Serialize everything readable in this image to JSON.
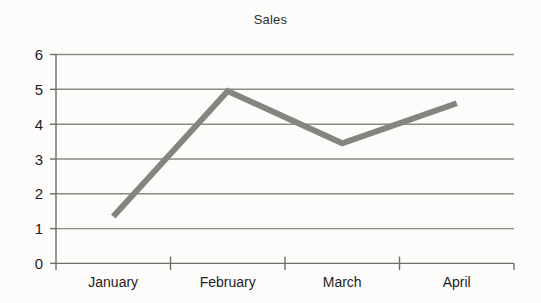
{
  "chart_data": {
    "type": "line",
    "title": "Sales",
    "xlabel": "",
    "ylabel": "",
    "categories": [
      "January",
      "February",
      "March",
      "April"
    ],
    "values": [
      1.35,
      4.95,
      3.45,
      4.6
    ],
    "series": [
      {
        "name": "Sales",
        "values": [
          1.35,
          4.95,
          3.45,
          4.6
        ],
        "color": "#848480"
      }
    ],
    "ylim": [
      0,
      6
    ],
    "yticks": [
      0,
      1,
      2,
      3,
      4,
      5,
      6
    ],
    "ytick_labels": [
      "0",
      "1",
      "2",
      "3",
      "4",
      "5",
      "6"
    ],
    "grid": true,
    "grid_axis": "y",
    "grid_color": "#8a8a84",
    "legend": false,
    "legend_position": "none",
    "line_width": 6,
    "markers": false,
    "background_color": "#fdfcfa",
    "axis_color": "#6e6e68",
    "text_color": "#1e1e1e"
  },
  "chart": {
    "title": "Sales",
    "y_axis_title": "",
    "x_axis_title": ""
  }
}
